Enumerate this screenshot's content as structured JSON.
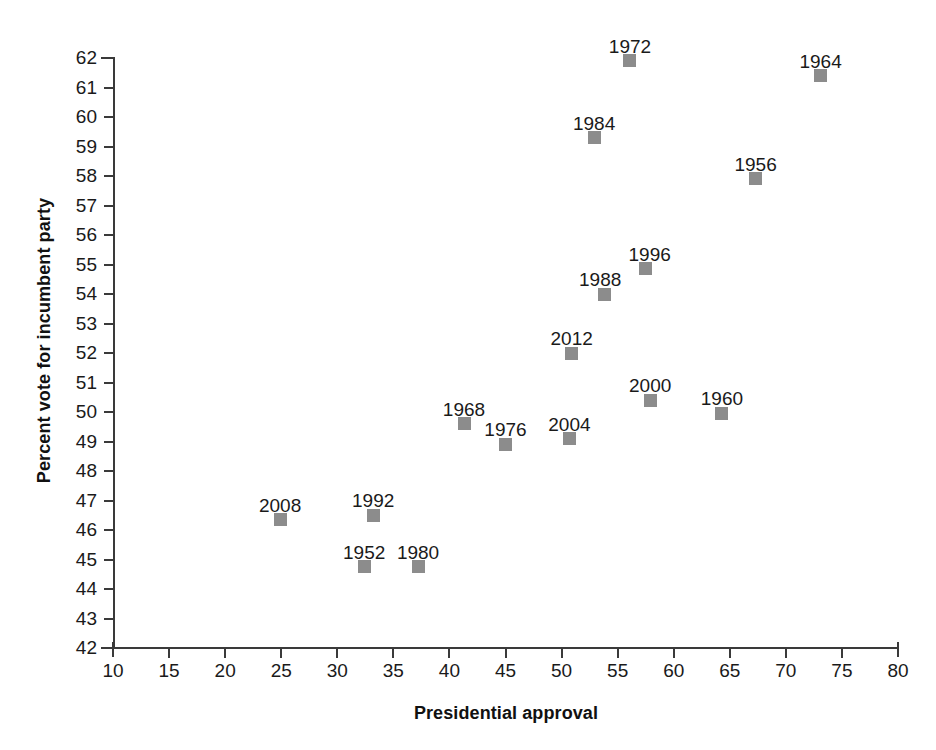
{
  "chart_data": {
    "type": "scatter",
    "title": "",
    "xlabel": "Presidential approval",
    "ylabel": "Percent vote for incumbent party",
    "xlim": [
      10,
      80
    ],
    "ylim": [
      42,
      62
    ],
    "x_ticks": [
      10,
      15,
      20,
      25,
      30,
      35,
      40,
      45,
      50,
      55,
      60,
      65,
      70,
      75,
      80
    ],
    "y_ticks": [
      42,
      43,
      44,
      45,
      46,
      47,
      48,
      49,
      50,
      51,
      52,
      53,
      54,
      55,
      56,
      57,
      58,
      59,
      60,
      61,
      62
    ],
    "grid": false,
    "legend": false,
    "marker": {
      "shape": "square",
      "color": "#8c8c8c",
      "size_px": 13
    },
    "points": [
      {
        "label": "1952",
        "x": 32.4,
        "y": 44.75,
        "label_dx": 0,
        "label_dy": -24
      },
      {
        "label": "1956",
        "x": 67.3,
        "y": 57.9,
        "label_dx": 0,
        "label_dy": -24
      },
      {
        "label": "1960",
        "x": 64.3,
        "y": 49.95,
        "label_dx": 0,
        "label_dy": -24
      },
      {
        "label": "1964",
        "x": 73.1,
        "y": 61.4,
        "label_dx": 0,
        "label_dy": -24
      },
      {
        "label": "1968",
        "x": 41.3,
        "y": 49.6,
        "label_dx": 0,
        "label_dy": -24
      },
      {
        "label": "1972",
        "x": 56.1,
        "y": 61.9,
        "label_dx": 0,
        "label_dy": -24
      },
      {
        "label": "1976",
        "x": 45.0,
        "y": 48.9,
        "label_dx": 0,
        "label_dy": -24
      },
      {
        "label": "1980",
        "x": 37.2,
        "y": 44.75,
        "label_dx": 0,
        "label_dy": -24
      },
      {
        "label": "1984",
        "x": 52.9,
        "y": 59.3,
        "label_dx": 0,
        "label_dy": -24
      },
      {
        "label": "1988",
        "x": 53.8,
        "y": 54.0,
        "label_dx": -4,
        "label_dy": -24
      },
      {
        "label": "1992",
        "x": 33.2,
        "y": 46.5,
        "label_dx": 0,
        "label_dy": -24
      },
      {
        "label": "1996",
        "x": 57.5,
        "y": 54.85,
        "label_dx": 4,
        "label_dy": -24
      },
      {
        "label": "2000",
        "x": 57.9,
        "y": 50.4,
        "label_dx": 0,
        "label_dy": -24
      },
      {
        "label": "2004",
        "x": 50.7,
        "y": 49.1,
        "label_dx": 0,
        "label_dy": -24
      },
      {
        "label": "2008",
        "x": 24.9,
        "y": 46.35,
        "label_dx": 0,
        "label_dy": -24
      },
      {
        "label": "2012",
        "x": 50.9,
        "y": 52.0,
        "label_dx": 0,
        "label_dy": -24
      }
    ]
  },
  "colors": {
    "background": "#ffffff",
    "axis": "#3a3a3a",
    "marker": "#8c8c8c",
    "text": "#1a1a1a"
  }
}
